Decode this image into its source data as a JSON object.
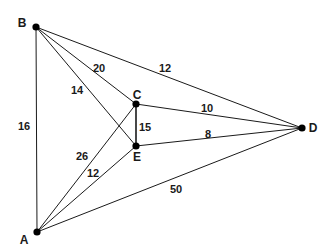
{
  "diagram": {
    "type": "weighted-undirected-graph",
    "nodes": [
      {
        "id": "A",
        "label": "A",
        "x": 37,
        "y": 232,
        "lx": 24,
        "ly": 244
      },
      {
        "id": "B",
        "label": "B",
        "x": 36,
        "y": 27,
        "lx": 22,
        "ly": 27
      },
      {
        "id": "C",
        "label": "C",
        "x": 136,
        "y": 104,
        "lx": 137,
        "ly": 99
      },
      {
        "id": "D",
        "label": "D",
        "x": 302,
        "y": 128,
        "lx": 313,
        "ly": 132
      },
      {
        "id": "E",
        "label": "E",
        "x": 136,
        "y": 146,
        "lx": 137,
        "ly": 161
      }
    ],
    "edges": [
      {
        "from": "B",
        "to": "A",
        "weight": "16",
        "lx": 24,
        "ly": 130
      },
      {
        "from": "B",
        "to": "D",
        "weight": "12",
        "lx": 165,
        "ly": 72
      },
      {
        "from": "B",
        "to": "C",
        "weight": "20",
        "lx": 99,
        "ly": 72
      },
      {
        "from": "B",
        "to": "E",
        "weight": "14",
        "lx": 77,
        "ly": 94
      },
      {
        "from": "C",
        "to": "E",
        "weight": "15",
        "lx": 145,
        "ly": 131
      },
      {
        "from": "C",
        "to": "D",
        "weight": "10",
        "lx": 207,
        "ly": 112
      },
      {
        "from": "E",
        "to": "D",
        "weight": "8",
        "lx": 208,
        "ly": 138
      },
      {
        "from": "A",
        "to": "C",
        "weight": "26",
        "lx": 82,
        "ly": 160
      },
      {
        "from": "A",
        "to": "E",
        "weight": "12",
        "lx": 93,
        "ly": 177
      },
      {
        "from": "A",
        "to": "D",
        "weight": "50",
        "lx": 176,
        "ly": 193
      }
    ]
  }
}
